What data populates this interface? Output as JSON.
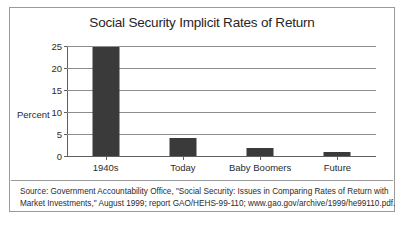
{
  "chart_data": {
    "type": "bar",
    "title": "Social Security Implicit Rates of Return",
    "xlabel": "",
    "ylabel": "Percent",
    "categories": [
      "1940s",
      "Today",
      "Baby Boomers",
      "Future"
    ],
    "values": [
      24.7,
      4.0,
      1.8,
      0.8
    ],
    "ylim": [
      0,
      25
    ],
    "yticks": [
      0,
      5,
      10,
      15,
      20,
      25
    ],
    "ytick_labels": [
      "0",
      "5",
      "10",
      "15",
      "20",
      "25"
    ],
    "grid": true,
    "legend": false,
    "bar_color": "#3a3a3a",
    "gridline_color": "#8d8d8d",
    "axis_color": "#5f5f5f"
  },
  "footer": {
    "line1": "Source: Government Accountability Office, \"Social Security: Issues in Comparing Rates of Return with",
    "line2": "Market Investments,\" August 1999; report GAO/HEHS-99-110; www.gao.gov/archive/1999/he99110.pdf."
  }
}
